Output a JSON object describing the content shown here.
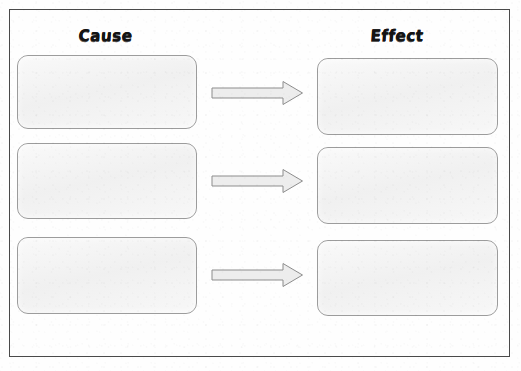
{
  "worksheet": {
    "title": "Cause and Effect Graphic Organizer",
    "background_color": "#fefefe",
    "frame_color": "#4a4a4a"
  },
  "columns": {
    "left": {
      "heading": "Cause"
    },
    "right": {
      "heading": "Effect"
    }
  },
  "box_style": {
    "fill_color": "#f1f1f1",
    "border_color": "#9c9c9c",
    "corner_radius": "11px"
  },
  "arrow_style": {
    "fill_color": "#ededed",
    "border_color": "#8d8d8d",
    "direction": "right"
  },
  "rows": [
    {
      "index": "1",
      "cause_text": "",
      "effect_text": "",
      "arrow_label": "leads to"
    },
    {
      "index": "2",
      "cause_text": "",
      "effect_text": "",
      "arrow_label": "leads to"
    },
    {
      "index": "3",
      "cause_text": "",
      "effect_text": "",
      "arrow_label": "leads to"
    }
  ]
}
